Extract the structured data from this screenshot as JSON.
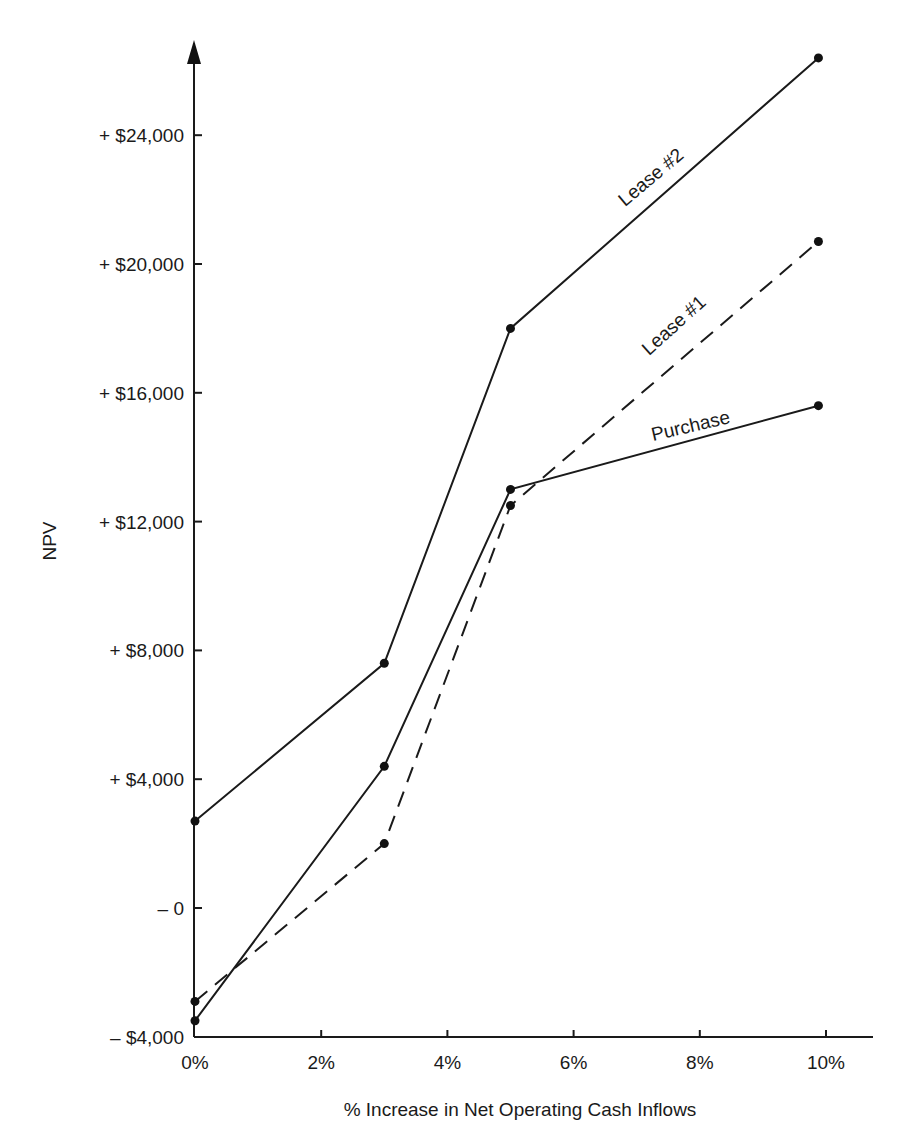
{
  "chart_data": {
    "type": "line",
    "title": "",
    "xlabel": "% Increase in Net Operating Cash Inflows",
    "ylabel": "NPV",
    "x_ticks": [
      "0%",
      "2%",
      "4%",
      "6%",
      "8%",
      "10%"
    ],
    "x_tick_values": [
      0,
      2,
      4,
      6,
      8,
      10
    ],
    "y_ticks": [
      "– $4,000",
      "– 0",
      "+ $4,000",
      "+ $8,000",
      "+ $12,000",
      "+ $16,000",
      "+ $20,000",
      "+ $24,000"
    ],
    "y_tick_values": [
      -4000,
      0,
      4000,
      8000,
      12000,
      16000,
      20000,
      24000
    ],
    "xlim": [
      0,
      10.8
    ],
    "ylim": [
      -4000,
      27000
    ],
    "grid": false,
    "legend": "inline labels on lines",
    "x": [
      0,
      3,
      5,
      10
    ],
    "series": [
      {
        "name": "Lease #2",
        "style": "solid",
        "values": [
          2700,
          7600,
          18000,
          26400
        ]
      },
      {
        "name": "Lease #1",
        "style": "dashed",
        "values": [
          -2900,
          2000,
          12500,
          20700
        ]
      },
      {
        "name": "Purchase",
        "style": "solid",
        "values": [
          -3500,
          4400,
          13000,
          15600
        ]
      }
    ]
  }
}
